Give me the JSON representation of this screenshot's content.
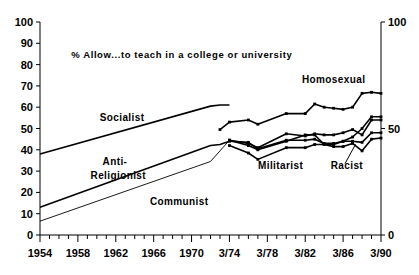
{
  "chart_data": {
    "type": "line",
    "title": "% Allow...to teach in a college or university",
    "xlabel": "",
    "ylabel": "",
    "ylim": [
      0,
      100
    ],
    "yticks": [
      0,
      10,
      20,
      30,
      40,
      50,
      60,
      70,
      80,
      90,
      100
    ],
    "ytick_labels_left": [
      "0",
      "10",
      "20",
      "30",
      "40",
      "50",
      "60",
      "70",
      "80",
      "90",
      "100"
    ],
    "ytick_labels_right": [
      "0",
      "50",
      "100"
    ],
    "xlim": [
      1954,
      1990
    ],
    "xticks": [
      1954,
      1958,
      1962,
      1966,
      1970,
      1974,
      1978,
      1982,
      1986,
      1990
    ],
    "xtick_labels": [
      "1954",
      "1958",
      "1962",
      "1966",
      "1970",
      "3/74",
      "3/78",
      "3/82",
      "3/86",
      "3/90"
    ],
    "minor_xticks_every": 1,
    "grid": false,
    "legend": "inline-labels",
    "series": [
      {
        "name": "Socialist",
        "label_x": 1960.3,
        "label_y": 53.5,
        "markers": false,
        "weight": "bold",
        "points": [
          {
            "x": 1954,
            "y": 38
          },
          {
            "x": 1972,
            "y": 60.5
          },
          {
            "x": 1973,
            "y": 61
          },
          {
            "x": 1974,
            "y": 61
          }
        ]
      },
      {
        "name": "Anti-Religionist",
        "label_x": 1960.6,
        "label_y": 33.0,
        "markers": false,
        "weight": "bold",
        "points": [
          {
            "x": 1954,
            "y": 13
          },
          {
            "x": 1972,
            "y": 42
          },
          {
            "x": 1973,
            "y": 42.5
          },
          {
            "x": 1974,
            "y": 44
          }
        ]
      },
      {
        "name": "Communist",
        "label_x": 1965.6,
        "label_y": 14.0,
        "markers": false,
        "weight": "thin",
        "points": [
          {
            "x": 1954,
            "y": 6.5
          },
          {
            "x": 1972,
            "y": 34.5
          },
          {
            "x": 1974,
            "y": 44.5
          }
        ]
      },
      {
        "name": "Homosexual",
        "label_x": 1985.0,
        "label_y": 71.5,
        "markers": true,
        "weight": "normal",
        "points": [
          {
            "x": 1973,
            "y": 49.5
          },
          {
            "x": 1974,
            "y": 53
          },
          {
            "x": 1976,
            "y": 54
          },
          {
            "x": 1977,
            "y": 52
          },
          {
            "x": 1980,
            "y": 57
          },
          {
            "x": 1982,
            "y": 57
          },
          {
            "x": 1983,
            "y": 61.5
          },
          {
            "x": 1984,
            "y": 60
          },
          {
            "x": 1985,
            "y": 59.5
          },
          {
            "x": 1986,
            "y": 59
          },
          {
            "x": 1987,
            "y": 60
          },
          {
            "x": 1988,
            "y": 66.5
          },
          {
            "x": 1989,
            "y": 67
          },
          {
            "x": 1990,
            "y": 66.5
          }
        ]
      },
      {
        "name": "Socialist-recent",
        "markers": true,
        "weight": "bold",
        "points": [
          {
            "x": 1974,
            "y": 44.5
          },
          {
            "x": 1976,
            "y": 43
          },
          {
            "x": 1977,
            "y": 41
          },
          {
            "x": 1980,
            "y": 47.5
          },
          {
            "x": 1982,
            "y": 46.5
          },
          {
            "x": 1983,
            "y": 47.5
          },
          {
            "x": 1984,
            "y": 47
          },
          {
            "x": 1985,
            "y": 47
          },
          {
            "x": 1986,
            "y": 48
          },
          {
            "x": 1987,
            "y": 49.5
          },
          {
            "x": 1988,
            "y": 47
          },
          {
            "x": 1989,
            "y": 54
          },
          {
            "x": 1990,
            "y": 54
          }
        ]
      },
      {
        "name": "Anti-Religionist-recent",
        "markers": true,
        "weight": "normal",
        "points": [
          {
            "x": 1974,
            "y": 44
          },
          {
            "x": 1976,
            "y": 43.5
          },
          {
            "x": 1977,
            "y": 40.5
          },
          {
            "x": 1980,
            "y": 44.5
          },
          {
            "x": 1982,
            "y": 44.5
          },
          {
            "x": 1983,
            "y": 45
          },
          {
            "x": 1984,
            "y": 43
          },
          {
            "x": 1985,
            "y": 43
          },
          {
            "x": 1986,
            "y": 44
          },
          {
            "x": 1987,
            "y": 46
          },
          {
            "x": 1988,
            "y": 50
          },
          {
            "x": 1989,
            "y": 55.5
          },
          {
            "x": 1990,
            "y": 55.5
          }
        ]
      },
      {
        "name": "Militarist",
        "label_x": 1979.4,
        "label_y": 31.0,
        "markers": true,
        "weight": "normal",
        "points": [
          {
            "x": 1974,
            "y": 44.5
          },
          {
            "x": 1976,
            "y": 42
          },
          {
            "x": 1977,
            "y": 40
          },
          {
            "x": 1980,
            "y": 44
          },
          {
            "x": 1982,
            "y": 47
          },
          {
            "x": 1983,
            "y": 47
          },
          {
            "x": 1984,
            "y": 42.5
          },
          {
            "x": 1985,
            "y": 42.5
          },
          {
            "x": 1986,
            "y": 44
          },
          {
            "x": 1987,
            "y": 44
          },
          {
            "x": 1988,
            "y": 43.5
          },
          {
            "x": 1989,
            "y": 48
          },
          {
            "x": 1990,
            "y": 48
          }
        ]
      },
      {
        "name": "Racist",
        "label_x": 1986.4,
        "label_y": 31.0,
        "markers": true,
        "weight": "normal",
        "points": [
          {
            "x": 1974,
            "y": 42
          },
          {
            "x": 1976,
            "y": 38.5
          },
          {
            "x": 1977,
            "y": 35.5
          },
          {
            "x": 1980,
            "y": 41
          },
          {
            "x": 1982,
            "y": 41
          },
          {
            "x": 1983,
            "y": 42.5
          },
          {
            "x": 1984,
            "y": 42.5
          },
          {
            "x": 1985,
            "y": 41.5
          },
          {
            "x": 1986,
            "y": 41.5
          },
          {
            "x": 1987,
            "y": 43
          },
          {
            "x": 1988,
            "y": 39.5
          },
          {
            "x": 1989,
            "y": 45
          },
          {
            "x": 1990,
            "y": 45.5
          }
        ]
      }
    ],
    "annotations": [
      {
        "name": "racist-leader",
        "x1": 1986.2,
        "y1": 33.5,
        "x2": 1987.3,
        "y2": 42.5
      }
    ]
  }
}
